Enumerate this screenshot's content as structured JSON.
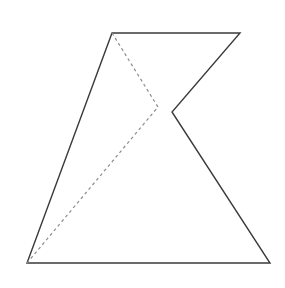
{
  "page": {
    "width": 285,
    "height": 288,
    "background_color": "#ffffff"
  },
  "caption": {
    "text": "如图所示，在△ABC中，",
    "state": "cropped-top",
    "color": "#4a4a4a"
  },
  "figure": {
    "stroke_color": "#3a3a3a",
    "dashed_color": "#8c8c8c",
    "stroke_width": 1.4,
    "dash_pattern": "3 3",
    "fill": "none",
    "points": {
      "top_left": {
        "x": 112,
        "y": 33
      },
      "top_right": {
        "x": 240,
        "y": 33
      },
      "notch_vertex": {
        "x": 172,
        "y": 112
      },
      "bottom_right": {
        "x": 270,
        "y": 263
      },
      "bottom_left": {
        "x": 27,
        "y": 263
      },
      "dashed_bend": {
        "x": 158,
        "y": 107
      }
    },
    "solid_outline_path": "M 112 33 L 240 33 L 172 112 L 270 263 L 27 263 Z",
    "dashed_path": "M 112 33 L 158 107 L 27 263",
    "segments": [
      {
        "name": "top-edge",
        "from": "top_left",
        "to": "top_right",
        "style": "solid"
      },
      {
        "name": "upper-right-edge",
        "from": "top_right",
        "to": "notch_vertex",
        "style": "solid"
      },
      {
        "name": "lower-right-edge",
        "from": "notch_vertex",
        "to": "bottom_right",
        "style": "solid"
      },
      {
        "name": "bottom-edge",
        "from": "bottom_right",
        "to": "bottom_left",
        "style": "solid"
      },
      {
        "name": "left-edge",
        "from": "bottom_left",
        "to": "top_left",
        "style": "solid"
      },
      {
        "name": "dashed-upper-segment",
        "from": "top_left",
        "to": "dashed_bend",
        "style": "dashed"
      },
      {
        "name": "dashed-lower-segment",
        "from": "dashed_bend",
        "to": "bottom_left",
        "style": "dashed"
      }
    ]
  }
}
